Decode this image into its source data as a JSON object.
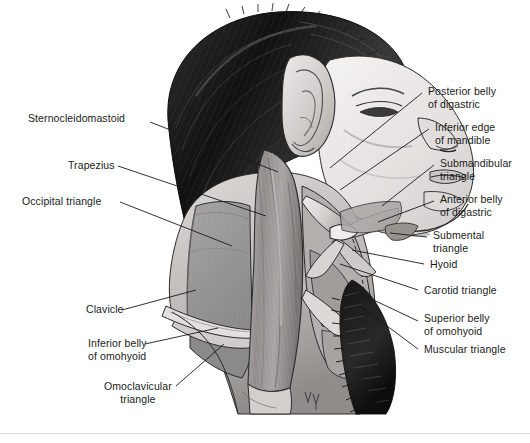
{
  "figure": {
    "background_color": "#ffffff",
    "line_color": "#1a1a1a",
    "shade_colors": {
      "hair_dark": "#1a1a1a",
      "skin_light": "#e8e6e4",
      "muscle_mid": "#a9a7a6",
      "triangle_fill": "#9b9997",
      "outline": "#2b2b2b"
    },
    "signature": "JV"
  },
  "labels": {
    "left": [
      {
        "id": "sternocleidomastoid",
        "text": "Sternocleidomastoid",
        "x": 28,
        "y": 118
      },
      {
        "id": "trapezius",
        "text": "Trapezius",
        "x": 68,
        "y": 162
      },
      {
        "id": "occipital-triangle",
        "text": "Occipital triangle",
        "x": 22,
        "y": 197
      },
      {
        "id": "clavicle",
        "text": "Clavicle",
        "x": 86,
        "y": 314
      },
      {
        "id": "inferior-belly-of-omohyoid",
        "text": "Inferior belly\nof omohyoid",
        "x": 88,
        "y": 345
      },
      {
        "id": "omoclavicular-triangle",
        "text": "Omoclavicular\ntriangle",
        "x": 104,
        "y": 388
      }
    ],
    "right": [
      {
        "id": "posterior-belly-of-digastric",
        "text": "Posterior belly\nof digastric",
        "x": 428,
        "y": 88
      },
      {
        "id": "inferior-edge-of-mandible",
        "text": "Inferior edge\nof mandible",
        "x": 435,
        "y": 124
      },
      {
        "id": "submandibular-triangle",
        "text": "Submandibular\ntriangle",
        "x": 440,
        "y": 160
      },
      {
        "id": "anterior-belly-of-digastric",
        "text": "Anterior belly\nof digastric",
        "x": 440,
        "y": 196
      },
      {
        "id": "submental-triangle",
        "text": "Submental\ntriangle",
        "x": 433,
        "y": 232
      },
      {
        "id": "hyoid",
        "text": "Hyoid",
        "x": 430,
        "y": 262
      },
      {
        "id": "carotid-triangle",
        "text": "Carotid triangle",
        "x": 424,
        "y": 288
      },
      {
        "id": "superior-belly-of-omohyoid",
        "text": "Superior belly\nof omohyoid",
        "x": 424,
        "y": 316
      },
      {
        "id": "muscular-triangle",
        "text": "Muscular triangle",
        "x": 424,
        "y": 347
      }
    ]
  }
}
